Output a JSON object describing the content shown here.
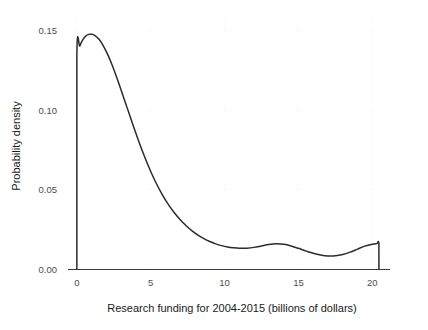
{
  "chart_data": {
    "type": "line",
    "title": "",
    "subtitle": "",
    "xlabel": "Research funding for 2004-2015 (billions of dollars)",
    "ylabel": "Probability density",
    "xlim": [
      -0.6,
      21.2
    ],
    "ylim": [
      0.0,
      0.158
    ],
    "xticks": [
      0,
      5,
      10,
      15,
      20
    ],
    "xtick_labels": [
      "0",
      "5",
      "10",
      "15",
      "20"
    ],
    "yticks": [
      0.0,
      0.05,
      0.1,
      0.15
    ],
    "ytick_labels": [
      "0.00",
      "0.05",
      "0.10",
      "0.15"
    ],
    "grid": true,
    "grid_color": "#fcfcfc",
    "legend": null,
    "legend_position": "none",
    "series": [
      {
        "name": "Probability density",
        "color": "#2b2b2b",
        "line_width": 1.5,
        "fill": false,
        "x": [
          0.0,
          0.0,
          0.2,
          0.4,
          0.6,
          0.8,
          1.0,
          1.2,
          1.5,
          1.8,
          2.1,
          2.4,
          2.7,
          3.0,
          3.4,
          3.8,
          4.2,
          4.6,
          5.0,
          5.4,
          5.8,
          6.2,
          6.6,
          7.0,
          7.4,
          7.8,
          8.2,
          8.6,
          9.0,
          9.4,
          9.8,
          10.2,
          10.6,
          11.0,
          11.5,
          12.0,
          12.5,
          13.0,
          13.5,
          14.0,
          14.5,
          15.0,
          15.5,
          16.0,
          16.5,
          17.0,
          17.5,
          18.0,
          18.5,
          19.0,
          19.5,
          20.0,
          20.3,
          20.45,
          20.45
        ],
        "y": [
          0.0,
          0.1345,
          0.1405,
          0.1443,
          0.1466,
          0.1477,
          0.1478,
          0.1471,
          0.1446,
          0.1404,
          0.1348,
          0.1281,
          0.1206,
          0.1126,
          0.1017,
          0.0908,
          0.0803,
          0.0705,
          0.0616,
          0.0537,
          0.0468,
          0.0408,
          0.0357,
          0.0313,
          0.0275,
          0.0243,
          0.0216,
          0.0194,
          0.0176,
          0.0161,
          0.015,
          0.0142,
          0.0137,
          0.0134,
          0.0134,
          0.0139,
          0.0148,
          0.0157,
          0.0161,
          0.0158,
          0.0148,
          0.0133,
          0.0117,
          0.0102,
          0.0091,
          0.0085,
          0.0086,
          0.0094,
          0.0109,
          0.0128,
          0.0147,
          0.0159,
          0.0163,
          0.0164,
          0.0
        ]
      }
    ],
    "annotations": [
      {
        "label": "peak",
        "x": 0.95,
        "y": 0.1478,
        "note": "global maximum of density"
      },
      {
        "label": "secondary-mode",
        "x": 13.1,
        "y": 0.0158,
        "note": "gentle local bump in tail"
      },
      {
        "label": "tail-trough",
        "x": 17.1,
        "y": 0.0085,
        "note": "local minimum in tail"
      },
      {
        "label": "right-boundary",
        "x": 20.45,
        "y": 0.0164,
        "note": "curve truncated with vertical drop to zero"
      }
    ]
  },
  "figure": {
    "background_color": "#ffffff",
    "axis_color": "#3a3a3a",
    "tick_label_color": "#4d4d4d",
    "label_color": "#1a1a1a"
  }
}
